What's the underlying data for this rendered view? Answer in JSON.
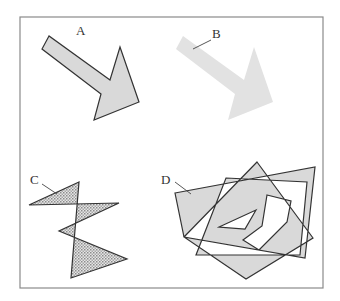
{
  "figure": {
    "panels": [
      {
        "id": "A",
        "label": "A",
        "description": "Filled arrow polygon with dark outline",
        "fill": "#d9d9d9",
        "stroke": "#333333"
      },
      {
        "id": "B",
        "label": "B",
        "description": "Filled arrow polygon without outline",
        "fill": "#e2e2e2",
        "stroke": "none"
      },
      {
        "id": "C",
        "label": "C",
        "description": "Self-intersecting zigzag polygon with dotted pattern fill",
        "fill": "pattern-dots",
        "stroke": "#333333"
      },
      {
        "id": "D",
        "label": "D",
        "description": "Overlapping polygons with holes, even-odd fill rule",
        "fill": "#d9d9d9",
        "stroke": "#333333"
      }
    ],
    "colors": {
      "frame": "#8a8a8a",
      "fill_gray": "#d9d9d9",
      "fill_light": "#e2e2e2",
      "outline": "#333333",
      "background": "#ffffff"
    }
  }
}
